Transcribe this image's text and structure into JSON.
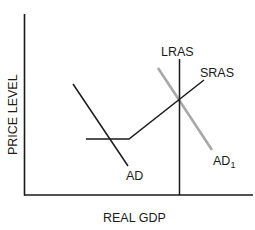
{
  "diagram": {
    "type": "AD-AS model",
    "axes": {
      "x_label": "REAL GDP",
      "y_label": "PRICE LEVEL"
    },
    "curves": [
      {
        "id": "lras",
        "label": "LRAS",
        "color": "#1a1a1a"
      },
      {
        "id": "sras",
        "label": "SRAS",
        "color": "#1a1a1a"
      },
      {
        "id": "ad",
        "label": "AD",
        "color": "#1a1a1a"
      },
      {
        "id": "ad1",
        "label": "AD",
        "subscript": "1",
        "color": "#a8a8a8"
      }
    ]
  }
}
